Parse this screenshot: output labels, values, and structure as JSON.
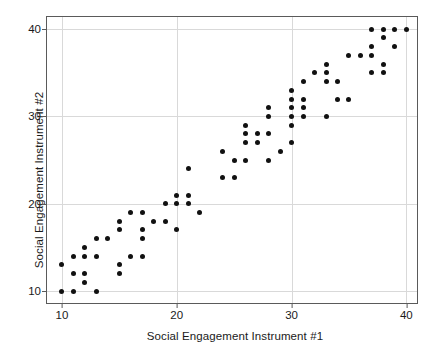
{
  "chart_data": {
    "type": "scatter",
    "title": "",
    "xlabel": "Social Engagement Instrument #1",
    "ylabel": "Social Engagement Instrument #2",
    "xlim": [
      8.7,
      41.1
    ],
    "ylim": [
      8.4,
      41.4
    ],
    "xticks": [
      10,
      20,
      30,
      40
    ],
    "yticks": [
      10,
      20,
      30,
      40
    ],
    "xtick_labels": [
      "10",
      "20",
      "30",
      "40"
    ],
    "ytick_labels": [
      "10",
      "20",
      "30",
      "40"
    ],
    "grid": true,
    "legend": "none",
    "marker": "circle",
    "marker_color": "#111111",
    "panel_background": "#ffffff",
    "grid_color": "#d9d9d9",
    "border_color": "#5a5a5a",
    "points": [
      [
        10,
        10
      ],
      [
        10,
        13
      ],
      [
        11,
        10
      ],
      [
        11,
        12
      ],
      [
        11,
        14
      ],
      [
        12,
        11
      ],
      [
        12,
        12
      ],
      [
        12,
        14
      ],
      [
        12,
        15
      ],
      [
        13,
        10
      ],
      [
        13,
        14
      ],
      [
        13,
        16
      ],
      [
        14,
        16
      ],
      [
        15,
        12
      ],
      [
        15,
        13
      ],
      [
        15,
        17
      ],
      [
        15,
        18
      ],
      [
        16,
        14
      ],
      [
        16,
        19
      ],
      [
        17,
        14
      ],
      [
        17,
        16
      ],
      [
        17,
        17
      ],
      [
        17,
        19
      ],
      [
        18,
        18
      ],
      [
        19,
        18
      ],
      [
        19,
        20
      ],
      [
        20,
        17
      ],
      [
        20,
        20
      ],
      [
        20,
        21
      ],
      [
        21,
        20
      ],
      [
        21,
        21
      ],
      [
        21,
        24
      ],
      [
        22,
        19
      ],
      [
        24,
        23
      ],
      [
        24,
        26
      ],
      [
        25,
        23
      ],
      [
        25,
        25
      ],
      [
        26,
        25
      ],
      [
        26,
        27
      ],
      [
        26,
        28
      ],
      [
        26,
        29
      ],
      [
        27,
        27
      ],
      [
        27,
        28
      ],
      [
        28,
        25
      ],
      [
        28,
        28
      ],
      [
        28,
        30
      ],
      [
        28,
        31
      ],
      [
        29,
        26
      ],
      [
        30,
        27
      ],
      [
        30,
        29
      ],
      [
        30,
        30
      ],
      [
        30,
        31
      ],
      [
        30,
        32
      ],
      [
        30,
        33
      ],
      [
        31,
        30
      ],
      [
        31,
        31
      ],
      [
        31,
        32
      ],
      [
        31,
        34
      ],
      [
        32,
        35
      ],
      [
        33,
        30
      ],
      [
        33,
        34
      ],
      [
        33,
        35
      ],
      [
        33,
        36
      ],
      [
        34,
        32
      ],
      [
        34,
        34
      ],
      [
        35,
        32
      ],
      [
        35,
        37
      ],
      [
        36,
        37
      ],
      [
        37,
        35
      ],
      [
        37,
        37
      ],
      [
        37,
        38
      ],
      [
        37,
        40
      ],
      [
        38,
        35
      ],
      [
        38,
        36
      ],
      [
        38,
        39
      ],
      [
        38,
        40
      ],
      [
        39,
        38
      ],
      [
        39,
        40
      ],
      [
        40,
        40
      ]
    ]
  }
}
